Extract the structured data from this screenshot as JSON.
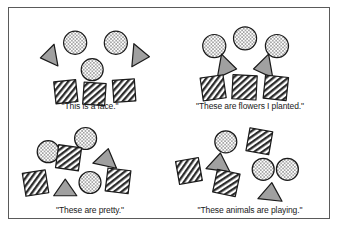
{
  "figure": {
    "border_color": "#5a5a5a",
    "background": "#ffffff",
    "shape_colors": {
      "circle_fill": "#ffffff",
      "circle_dots": "#2b2b2b",
      "square_fill": "#ffffff",
      "square_hatch": "#2b2b2b",
      "triangle_fill": "#a0a0a0",
      "outline": "#1a1a1a"
    }
  },
  "panels": [
    {
      "id": "panel-face",
      "caption": "\"This is a face.\"",
      "arrangement": "organized-face",
      "shapes": [
        {
          "type": "triangle",
          "texture": "solid-gray",
          "x": 22,
          "y": 30,
          "size": 20,
          "rotation": -100
        },
        {
          "type": "circle",
          "texture": "dotted",
          "x": 46,
          "y": 17,
          "size": 21,
          "rotation": 0
        },
        {
          "type": "circle",
          "texture": "dotted",
          "x": 83,
          "y": 17,
          "size": 21,
          "rotation": 0
        },
        {
          "type": "triangle",
          "texture": "solid-gray",
          "x": 106,
          "y": 29,
          "size": 21,
          "rotation": 95
        },
        {
          "type": "circle",
          "texture": "dotted",
          "x": 62,
          "y": 42,
          "size": 20,
          "rotation": 0
        },
        {
          "type": "square",
          "texture": "hatched",
          "x": 38,
          "y": 62,
          "size": 20,
          "rotation": -6
        },
        {
          "type": "square",
          "texture": "hatched",
          "x": 64,
          "y": 64,
          "size": 20,
          "rotation": 4
        },
        {
          "type": "square",
          "texture": "hatched",
          "x": 91,
          "y": 61,
          "size": 20,
          "rotation": -4
        }
      ]
    },
    {
      "id": "panel-flowers",
      "caption": "\"These are flowers I planted.\"",
      "arrangement": "organized-flowers",
      "shapes": [
        {
          "type": "circle",
          "texture": "dotted",
          "x": 27,
          "y": 20,
          "size": 21,
          "rotation": 0
        },
        {
          "type": "circle",
          "texture": "dotted",
          "x": 55,
          "y": 13,
          "size": 21,
          "rotation": 0
        },
        {
          "type": "circle",
          "texture": "dotted",
          "x": 84,
          "y": 20,
          "size": 21,
          "rotation": 0
        },
        {
          "type": "triangle",
          "texture": "solid-gray",
          "x": 39,
          "y": 39,
          "size": 22,
          "rotation": 100
        },
        {
          "type": "triangle",
          "texture": "solid-gray",
          "x": 70,
          "y": 39,
          "size": 22,
          "rotation": -100
        },
        {
          "type": "square",
          "texture": "hatched",
          "x": 26,
          "y": 58,
          "size": 21,
          "rotation": -8
        },
        {
          "type": "square",
          "texture": "hatched",
          "x": 54,
          "y": 57,
          "size": 22,
          "rotation": 3
        },
        {
          "type": "square",
          "texture": "hatched",
          "x": 83,
          "y": 58,
          "size": 21,
          "rotation": 6
        }
      ]
    },
    {
      "id": "panel-pretty",
      "caption": "\"These are pretty.\"",
      "arrangement": "scattered",
      "shapes": [
        {
          "type": "circle",
          "texture": "dotted",
          "x": 22,
          "y": 22,
          "size": 20,
          "rotation": 0
        },
        {
          "type": "circle",
          "texture": "dotted",
          "x": 56,
          "y": 10,
          "size": 20,
          "rotation": 0
        },
        {
          "type": "square",
          "texture": "hatched",
          "x": 40,
          "y": 27,
          "size": 21,
          "rotation": 8
        },
        {
          "type": "triangle",
          "texture": "solid-gray",
          "x": 74,
          "y": 26,
          "size": 22,
          "rotation": 12
        },
        {
          "type": "square",
          "texture": "hatched",
          "x": 10,
          "y": 50,
          "size": 21,
          "rotation": -9
        },
        {
          "type": "triangle",
          "texture": "solid-gray",
          "x": 37,
          "y": 54,
          "size": 21,
          "rotation": 0
        },
        {
          "type": "circle",
          "texture": "dotted",
          "x": 60,
          "y": 50,
          "size": 20,
          "rotation": 0
        },
        {
          "type": "square",
          "texture": "hatched",
          "x": 85,
          "y": 48,
          "size": 21,
          "rotation": 7
        }
      ]
    },
    {
      "id": "panel-animals",
      "caption": "\"These animals are playing.\"",
      "arrangement": "scattered",
      "shapes": [
        {
          "type": "circle",
          "texture": "dotted",
          "x": 38,
          "y": 13,
          "size": 20,
          "rotation": 0
        },
        {
          "type": "square",
          "texture": "hatched",
          "x": 68,
          "y": 12,
          "size": 21,
          "rotation": 10
        },
        {
          "type": "triangle",
          "texture": "solid-gray",
          "x": 31,
          "y": 30,
          "size": 22,
          "rotation": 8
        },
        {
          "type": "square",
          "texture": "hatched",
          "x": 4,
          "y": 39,
          "size": 21,
          "rotation": -10
        },
        {
          "type": "circle",
          "texture": "dotted",
          "x": 72,
          "y": 38,
          "size": 20,
          "rotation": 0
        },
        {
          "type": "circle",
          "texture": "dotted",
          "x": 94,
          "y": 38,
          "size": 20,
          "rotation": 0
        },
        {
          "type": "square",
          "texture": "hatched",
          "x": 38,
          "y": 50,
          "size": 21,
          "rotation": 12
        },
        {
          "type": "triangle",
          "texture": "solid-gray",
          "x": 78,
          "y": 57,
          "size": 22,
          "rotation": 6
        }
      ]
    }
  ]
}
